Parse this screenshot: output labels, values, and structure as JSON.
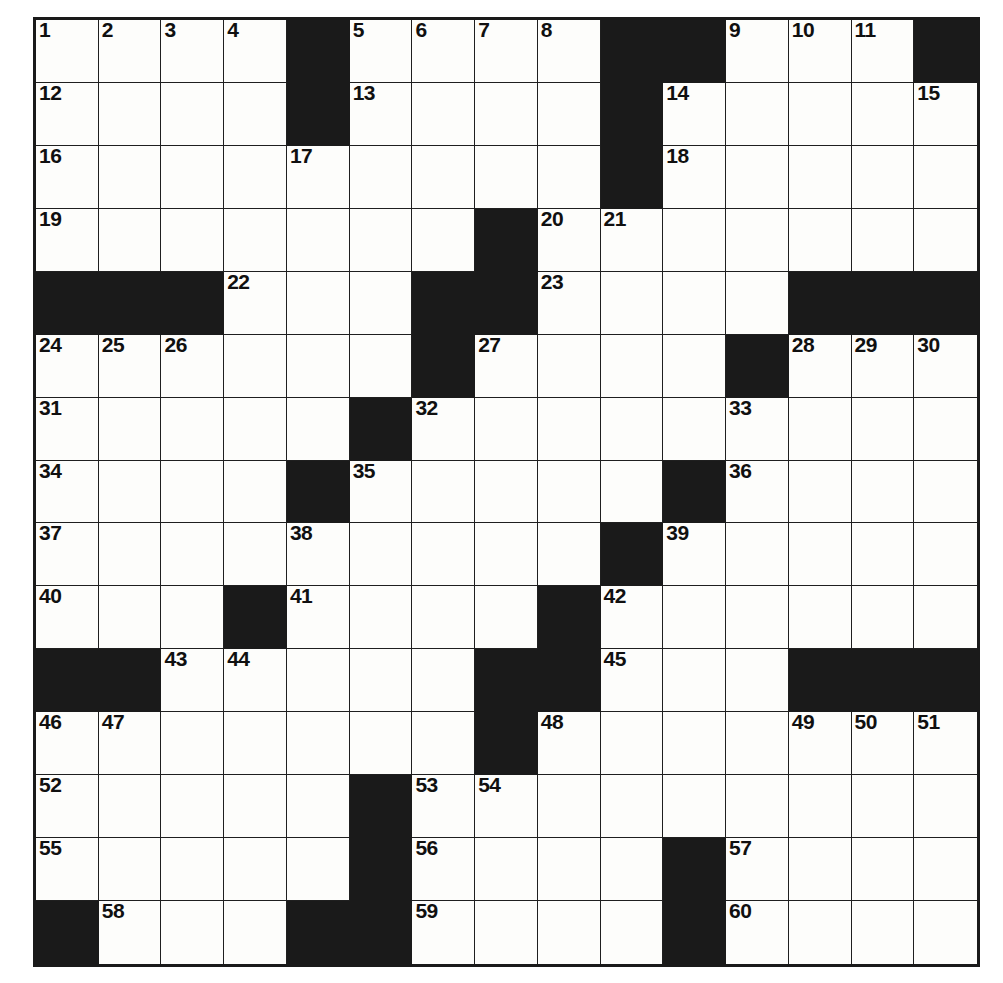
{
  "puzzle": {
    "type": "crossword-grid",
    "rows": 15,
    "columns": 15,
    "colors": {
      "block": "#1a1a1a",
      "open": "#fdfdfb",
      "gridline": "#1f1f1f",
      "number_text": "#101010"
    },
    "cells": [
      [
        {
          "n": "1",
          "b": false
        },
        {
          "n": "2",
          "b": false
        },
        {
          "n": "3",
          "b": false
        },
        {
          "n": "4",
          "b": false
        },
        {
          "n": "",
          "b": true
        },
        {
          "n": "5",
          "b": false
        },
        {
          "n": "6",
          "b": false
        },
        {
          "n": "7",
          "b": false
        },
        {
          "n": "8",
          "b": false
        },
        {
          "n": "",
          "b": true
        },
        {
          "n": "",
          "b": true
        },
        {
          "n": "9",
          "b": false
        },
        {
          "n": "10",
          "b": false
        },
        {
          "n": "11",
          "b": false
        },
        {
          "n": "",
          "b": true
        }
      ],
      [
        {
          "n": "12",
          "b": false
        },
        {
          "n": "",
          "b": false
        },
        {
          "n": "",
          "b": false
        },
        {
          "n": "",
          "b": false
        },
        {
          "n": "",
          "b": true
        },
        {
          "n": "13",
          "b": false
        },
        {
          "n": "",
          "b": false
        },
        {
          "n": "",
          "b": false
        },
        {
          "n": "",
          "b": false
        },
        {
          "n": "",
          "b": true
        },
        {
          "n": "14",
          "b": false
        },
        {
          "n": "",
          "b": false
        },
        {
          "n": "",
          "b": false
        },
        {
          "n": "",
          "b": false
        },
        {
          "n": "15",
          "b": false
        }
      ],
      [
        {
          "n": "16",
          "b": false
        },
        {
          "n": "",
          "b": false
        },
        {
          "n": "",
          "b": false
        },
        {
          "n": "",
          "b": false
        },
        {
          "n": "17",
          "b": false
        },
        {
          "n": "",
          "b": false
        },
        {
          "n": "",
          "b": false
        },
        {
          "n": "",
          "b": false
        },
        {
          "n": "",
          "b": false
        },
        {
          "n": "",
          "b": true
        },
        {
          "n": "18",
          "b": false
        },
        {
          "n": "",
          "b": false
        },
        {
          "n": "",
          "b": false
        },
        {
          "n": "",
          "b": false
        },
        {
          "n": "",
          "b": false
        }
      ],
      [
        {
          "n": "19",
          "b": false
        },
        {
          "n": "",
          "b": false
        },
        {
          "n": "",
          "b": false
        },
        {
          "n": "",
          "b": false
        },
        {
          "n": "",
          "b": false
        },
        {
          "n": "",
          "b": false
        },
        {
          "n": "",
          "b": false
        },
        {
          "n": "",
          "b": true
        },
        {
          "n": "20",
          "b": false
        },
        {
          "n": "21",
          "b": false
        },
        {
          "n": "",
          "b": false
        },
        {
          "n": "",
          "b": false
        },
        {
          "n": "",
          "b": false
        },
        {
          "n": "",
          "b": false
        },
        {
          "n": "",
          "b": false
        }
      ],
      [
        {
          "n": "",
          "b": true
        },
        {
          "n": "",
          "b": true
        },
        {
          "n": "",
          "b": true
        },
        {
          "n": "22",
          "b": false
        },
        {
          "n": "",
          "b": false
        },
        {
          "n": "",
          "b": false
        },
        {
          "n": "",
          "b": true
        },
        {
          "n": "",
          "b": true
        },
        {
          "n": "23",
          "b": false
        },
        {
          "n": "",
          "b": false
        },
        {
          "n": "",
          "b": false
        },
        {
          "n": "",
          "b": false
        },
        {
          "n": "",
          "b": true
        },
        {
          "n": "",
          "b": true
        },
        {
          "n": "",
          "b": true
        }
      ],
      [
        {
          "n": "24",
          "b": false
        },
        {
          "n": "25",
          "b": false
        },
        {
          "n": "26",
          "b": false
        },
        {
          "n": "",
          "b": false
        },
        {
          "n": "",
          "b": false
        },
        {
          "n": "",
          "b": false
        },
        {
          "n": "",
          "b": true
        },
        {
          "n": "27",
          "b": false
        },
        {
          "n": "",
          "b": false
        },
        {
          "n": "",
          "b": false
        },
        {
          "n": "",
          "b": false
        },
        {
          "n": "",
          "b": true
        },
        {
          "n": "28",
          "b": false
        },
        {
          "n": "29",
          "b": false
        },
        {
          "n": "30",
          "b": false
        }
      ],
      [
        {
          "n": "31",
          "b": false
        },
        {
          "n": "",
          "b": false
        },
        {
          "n": "",
          "b": false
        },
        {
          "n": "",
          "b": false
        },
        {
          "n": "",
          "b": false
        },
        {
          "n": "",
          "b": true
        },
        {
          "n": "32",
          "b": false
        },
        {
          "n": "",
          "b": false
        },
        {
          "n": "",
          "b": false
        },
        {
          "n": "",
          "b": false
        },
        {
          "n": "",
          "b": false
        },
        {
          "n": "33",
          "b": false
        },
        {
          "n": "",
          "b": false
        },
        {
          "n": "",
          "b": false
        },
        {
          "n": "",
          "b": false
        }
      ],
      [
        {
          "n": "34",
          "b": false
        },
        {
          "n": "",
          "b": false
        },
        {
          "n": "",
          "b": false
        },
        {
          "n": "",
          "b": false
        },
        {
          "n": "",
          "b": true
        },
        {
          "n": "35",
          "b": false
        },
        {
          "n": "",
          "b": false
        },
        {
          "n": "",
          "b": false
        },
        {
          "n": "",
          "b": false
        },
        {
          "n": "",
          "b": false
        },
        {
          "n": "",
          "b": true
        },
        {
          "n": "36",
          "b": false
        },
        {
          "n": "",
          "b": false
        },
        {
          "n": "",
          "b": false
        },
        {
          "n": "",
          "b": false
        }
      ],
      [
        {
          "n": "37",
          "b": false
        },
        {
          "n": "",
          "b": false
        },
        {
          "n": "",
          "b": false
        },
        {
          "n": "",
          "b": false
        },
        {
          "n": "38",
          "b": false
        },
        {
          "n": "",
          "b": false
        },
        {
          "n": "",
          "b": false
        },
        {
          "n": "",
          "b": false
        },
        {
          "n": "",
          "b": false
        },
        {
          "n": "",
          "b": true
        },
        {
          "n": "39",
          "b": false
        },
        {
          "n": "",
          "b": false
        },
        {
          "n": "",
          "b": false
        },
        {
          "n": "",
          "b": false
        },
        {
          "n": "",
          "b": false
        }
      ],
      [
        {
          "n": "40",
          "b": false
        },
        {
          "n": "",
          "b": false
        },
        {
          "n": "",
          "b": false
        },
        {
          "n": "",
          "b": true
        },
        {
          "n": "41",
          "b": false
        },
        {
          "n": "",
          "b": false
        },
        {
          "n": "",
          "b": false
        },
        {
          "n": "",
          "b": false
        },
        {
          "n": "",
          "b": true
        },
        {
          "n": "42",
          "b": false
        },
        {
          "n": "",
          "b": false
        },
        {
          "n": "",
          "b": false
        },
        {
          "n": "",
          "b": false
        },
        {
          "n": "",
          "b": false
        },
        {
          "n": "",
          "b": false
        }
      ],
      [
        {
          "n": "",
          "b": true
        },
        {
          "n": "",
          "b": true
        },
        {
          "n": "43",
          "b": false
        },
        {
          "n": "44",
          "b": false
        },
        {
          "n": "",
          "b": false
        },
        {
          "n": "",
          "b": false
        },
        {
          "n": "",
          "b": false
        },
        {
          "n": "",
          "b": true
        },
        {
          "n": "",
          "b": true
        },
        {
          "n": "45",
          "b": false
        },
        {
          "n": "",
          "b": false
        },
        {
          "n": "",
          "b": false
        },
        {
          "n": "",
          "b": true
        },
        {
          "n": "",
          "b": true
        },
        {
          "n": "",
          "b": true
        }
      ],
      [
        {
          "n": "46",
          "b": false
        },
        {
          "n": "47",
          "b": false
        },
        {
          "n": "",
          "b": false
        },
        {
          "n": "",
          "b": false
        },
        {
          "n": "",
          "b": false
        },
        {
          "n": "",
          "b": false
        },
        {
          "n": "",
          "b": false
        },
        {
          "n": "",
          "b": true
        },
        {
          "n": "48",
          "b": false
        },
        {
          "n": "",
          "b": false
        },
        {
          "n": "",
          "b": false
        },
        {
          "n": "",
          "b": false
        },
        {
          "n": "49",
          "b": false
        },
        {
          "n": "50",
          "b": false
        },
        {
          "n": "51",
          "b": false
        }
      ],
      [
        {
          "n": "52",
          "b": false
        },
        {
          "n": "",
          "b": false
        },
        {
          "n": "",
          "b": false
        },
        {
          "n": "",
          "b": false
        },
        {
          "n": "",
          "b": false
        },
        {
          "n": "",
          "b": true
        },
        {
          "n": "53",
          "b": false
        },
        {
          "n": "54",
          "b": false
        },
        {
          "n": "",
          "b": false
        },
        {
          "n": "",
          "b": false
        },
        {
          "n": "",
          "b": false
        },
        {
          "n": "",
          "b": false
        },
        {
          "n": "",
          "b": false
        },
        {
          "n": "",
          "b": false
        },
        {
          "n": "",
          "b": false
        }
      ],
      [
        {
          "n": "55",
          "b": false
        },
        {
          "n": "",
          "b": false
        },
        {
          "n": "",
          "b": false
        },
        {
          "n": "",
          "b": false
        },
        {
          "n": "",
          "b": false
        },
        {
          "n": "",
          "b": true
        },
        {
          "n": "56",
          "b": false
        },
        {
          "n": "",
          "b": false
        },
        {
          "n": "",
          "b": false
        },
        {
          "n": "",
          "b": false
        },
        {
          "n": "",
          "b": true
        },
        {
          "n": "57",
          "b": false
        },
        {
          "n": "",
          "b": false
        },
        {
          "n": "",
          "b": false
        },
        {
          "n": "",
          "b": false
        }
      ],
      [
        {
          "n": "",
          "b": true
        },
        {
          "n": "58",
          "b": false
        },
        {
          "n": "",
          "b": false
        },
        {
          "n": "",
          "b": false
        },
        {
          "n": "",
          "b": true
        },
        {
          "n": "",
          "b": true
        },
        {
          "n": "59",
          "b": false
        },
        {
          "n": "",
          "b": false
        },
        {
          "n": "",
          "b": false
        },
        {
          "n": "",
          "b": false
        },
        {
          "n": "",
          "b": true
        },
        {
          "n": "60",
          "b": false
        },
        {
          "n": "",
          "b": false
        },
        {
          "n": "",
          "b": false
        },
        {
          "n": "",
          "b": false
        }
      ]
    ],
    "clue_numbers": [
      "1",
      "2",
      "3",
      "4",
      "5",
      "6",
      "7",
      "8",
      "9",
      "10",
      "11",
      "12",
      "13",
      "14",
      "15",
      "16",
      "17",
      "18",
      "19",
      "20",
      "21",
      "22",
      "23",
      "24",
      "25",
      "26",
      "27",
      "28",
      "29",
      "30",
      "31",
      "32",
      "33",
      "34",
      "35",
      "36",
      "37",
      "38",
      "39",
      "40",
      "41",
      "42",
      "43",
      "44",
      "45",
      "46",
      "47",
      "48",
      "49",
      "50",
      "51",
      "52",
      "53",
      "54",
      "55",
      "56",
      "57",
      "58",
      "59",
      "60"
    ]
  }
}
